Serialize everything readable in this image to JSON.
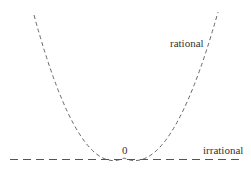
{
  "diagram": {
    "title": "",
    "labels": {
      "curve": "rational",
      "line": "irrational",
      "vertex": "0"
    },
    "elements": [
      {
        "type": "dashed-parabola",
        "label": "rational",
        "vertex": [
          124,
          158
        ],
        "left_top": [
          34,
          15
        ],
        "right_top": [
          218,
          12
        ]
      },
      {
        "type": "dashed-horizontal-line",
        "label": "irrational",
        "y": 159,
        "x_from": 10,
        "x_to": 243
      }
    ],
    "colors": {
      "stroke": "#666666",
      "text": "#333333",
      "background": "#ffffff"
    }
  }
}
